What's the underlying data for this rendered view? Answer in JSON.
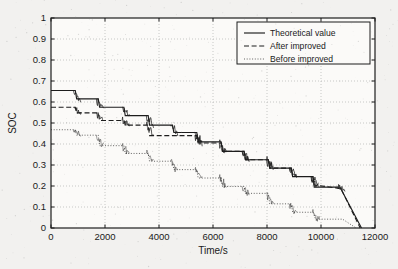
{
  "figure": {
    "background_color": "#f2f1ef",
    "line_color": "#1d1d1d",
    "grid_color": "#b3b3b3"
  },
  "chart_data": {
    "type": "line",
    "title": "",
    "xlabel": "Time/s",
    "ylabel": "SOC",
    "xlim": [
      0,
      12000
    ],
    "ylim": [
      0,
      1
    ],
    "grid": true,
    "xticks": [
      0,
      2000,
      4000,
      6000,
      8000,
      10000,
      12000
    ],
    "xtick_labels": [
      "0",
      "2000",
      "4000",
      "6000",
      "8000",
      "10000",
      "12000"
    ],
    "yticks": [
      0,
      0.1,
      0.2,
      0.3,
      0.4,
      0.5,
      0.6,
      0.7,
      0.8,
      0.9,
      1
    ],
    "ytick_labels": [
      "0",
      "0.1",
      "0.2",
      "0.3",
      "0.4",
      "0.5",
      "0.6",
      "0.7",
      "0.8",
      "0.9",
      "1"
    ],
    "legend_position": "upper right",
    "series": [
      {
        "name": "Theoretical value",
        "style": "solid",
        "x": [
          0,
          120,
          900,
          950,
          1750,
          1800,
          2700,
          2750,
          3600,
          3650,
          4500,
          4550,
          5400,
          5450,
          6300,
          6350,
          7150,
          7200,
          8050,
          8100,
          8900,
          8950,
          9700,
          9750,
          10600,
          10700,
          11500
        ],
        "y": [
          0.655,
          0.655,
          0.655,
          0.615,
          0.615,
          0.575,
          0.575,
          0.535,
          0.535,
          0.49,
          0.49,
          0.455,
          0.455,
          0.41,
          0.41,
          0.365,
          0.365,
          0.325,
          0.325,
          0.285,
          0.285,
          0.245,
          0.245,
          0.195,
          0.195,
          0.195,
          0.0
        ]
      },
      {
        "name": "After improved",
        "style": "dashed",
        "x": [
          0,
          120,
          900,
          950,
          1750,
          1800,
          2700,
          2750,
          3600,
          3650,
          4500,
          4550,
          5400,
          5450,
          6300,
          6350,
          7150,
          7200,
          8050,
          8100,
          8900,
          8950,
          9700,
          9750,
          10600,
          10750,
          11450
        ],
        "y": [
          0.575,
          0.575,
          0.575,
          0.548,
          0.548,
          0.512,
          0.512,
          0.49,
          0.49,
          0.44,
          0.44,
          0.44,
          0.44,
          0.405,
          0.405,
          0.365,
          0.365,
          0.325,
          0.325,
          0.285,
          0.285,
          0.245,
          0.245,
          0.205,
          0.19,
          0.185,
          0.0
        ]
      },
      {
        "name": "Before improved",
        "style": "dotted",
        "x": [
          0,
          120,
          900,
          950,
          1750,
          1800,
          2700,
          2750,
          3600,
          3650,
          4500,
          4550,
          5400,
          5450,
          6300,
          6350,
          7150,
          7200,
          8050,
          8100,
          8900,
          8950,
          9700,
          9800,
          10650,
          10800,
          11300
        ],
        "y": [
          0.468,
          0.468,
          0.468,
          0.442,
          0.442,
          0.392,
          0.392,
          0.355,
          0.355,
          0.318,
          0.318,
          0.278,
          0.278,
          0.238,
          0.238,
          0.198,
          0.198,
          0.165,
          0.165,
          0.115,
          0.115,
          0.075,
          0.075,
          0.042,
          0.042,
          0.042,
          0.0
        ]
      }
    ]
  },
  "legend": {
    "items": [
      {
        "label": "Theoretical value",
        "style": "solid"
      },
      {
        "label": "After improved",
        "style": "dashed"
      },
      {
        "label": "Before improved",
        "style": "dotted"
      }
    ]
  }
}
